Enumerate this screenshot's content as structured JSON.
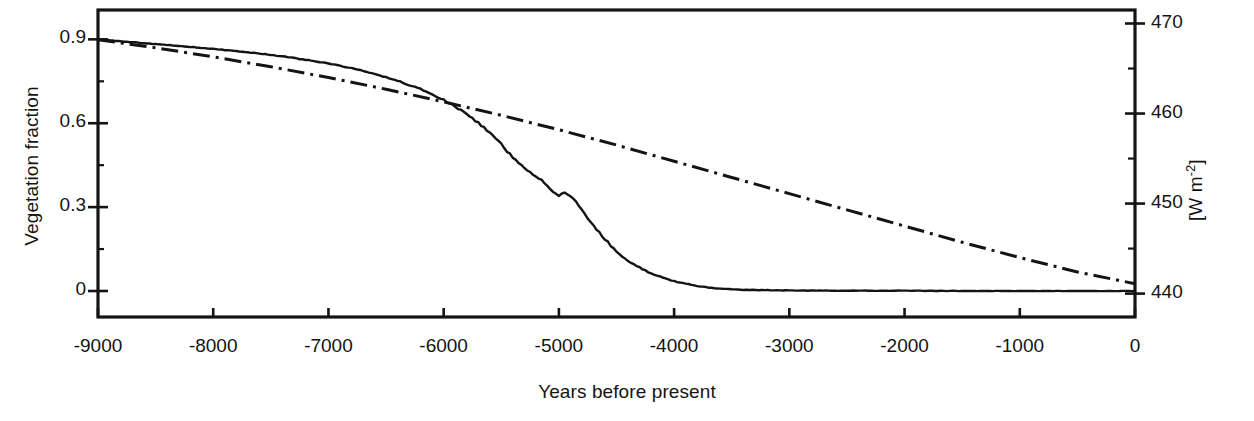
{
  "figure": {
    "background": "#ffffff",
    "ink": "#141414"
  },
  "axes": {
    "x": {
      "label": "Years before present",
      "min": -9000,
      "max": 0,
      "ticks": [
        -9000,
        -8000,
        -7000,
        -6000,
        -5000,
        -4000,
        -3000,
        -2000,
        -1000,
        0
      ],
      "tick_labels": [
        "-9000",
        "-8000",
        "-7000",
        "-6000",
        "-5000",
        "-4000",
        "-3000",
        "-2000",
        "-1000",
        "0"
      ]
    },
    "y_left": {
      "label": "Vegetation fraction",
      "min": -0.093,
      "max": 1.005,
      "ticks": [
        0,
        0.3,
        0.6,
        0.9
      ],
      "tick_labels": [
        "0",
        "0.3",
        "0.6",
        "0.9"
      ],
      "minor_ticks": [
        0.15,
        0.45,
        0.75
      ]
    },
    "y_right": {
      "label_prefix": "[W m",
      "label_exponent": "-2",
      "label_suffix": "]",
      "label_plain": "[W m-2]",
      "min": 437.4,
      "max": 471.5,
      "ticks": [
        440,
        450,
        460,
        470
      ],
      "tick_labels": [
        "440",
        "450",
        "460",
        "470"
      ],
      "minor_ticks": [
        445,
        455,
        465
      ]
    }
  },
  "chart_data": {
    "type": "line",
    "title": "",
    "xlabel": "Years before present",
    "ylabel": "Vegetation fraction",
    "ylabel_secondary": "[W m-2]",
    "xlim": [
      -9000,
      0
    ],
    "ylim": [
      -0.093,
      1.005
    ],
    "ylim_secondary": [
      437.4,
      471.5
    ],
    "grid": false,
    "legend": "none",
    "series": [
      {
        "name": "Vegetation fraction",
        "axis": "left",
        "style": "solid",
        "color": "#141414",
        "x": [
          -9000,
          -8800,
          -8600,
          -8400,
          -8200,
          -8000,
          -7800,
          -7600,
          -7400,
          -7200,
          -7000,
          -6800,
          -6600,
          -6400,
          -6200,
          -6000,
          -5900,
          -5800,
          -5700,
          -5600,
          -5500,
          -5450,
          -5400,
          -5350,
          -5300,
          -5250,
          -5200,
          -5150,
          -5100,
          -5050,
          -5000,
          -4950,
          -4900,
          -4850,
          -4800,
          -4750,
          -4700,
          -4650,
          -4600,
          -4550,
          -4500,
          -4400,
          -4300,
          -4200,
          -4100,
          -4000,
          -3900,
          -3800,
          -3700,
          -3600,
          -3400,
          -3000,
          -2500,
          -2000,
          -1500,
          -1000,
          -500,
          0
        ],
        "y": [
          0.9,
          0.893,
          0.886,
          0.88,
          0.873,
          0.866,
          0.858,
          0.849,
          0.839,
          0.827,
          0.814,
          0.797,
          0.777,
          0.752,
          0.722,
          0.684,
          0.66,
          0.632,
          0.601,
          0.566,
          0.525,
          0.5,
          0.476,
          0.46,
          0.44,
          0.427,
          0.41,
          0.396,
          0.374,
          0.355,
          0.34,
          0.352,
          0.338,
          0.316,
          0.288,
          0.262,
          0.236,
          0.21,
          0.186,
          0.163,
          0.142,
          0.109,
          0.084,
          0.063,
          0.047,
          0.035,
          0.026,
          0.018,
          0.012,
          0.008,
          0.004,
          0.002,
          0.001,
          0.001,
          0.0,
          0.0,
          0.0,
          0.0
        ]
      },
      {
        "name": "Insolation",
        "axis": "right",
        "style": "dash-dot",
        "color": "#141414",
        "x": [
          -9000,
          -8500,
          -8000,
          -7500,
          -7000,
          -6500,
          -6000,
          -5500,
          -5000,
          -4500,
          -4000,
          -3500,
          -3000,
          -2500,
          -2000,
          -1500,
          -1000,
          -500,
          0
        ],
        "y": [
          468.2,
          467.3,
          466.3,
          465.2,
          464.0,
          462.7,
          461.3,
          459.8,
          458.2,
          456.5,
          454.7,
          452.9,
          451.1,
          449.3,
          447.5,
          445.7,
          444.0,
          442.4,
          441.1
        ]
      }
    ],
    "annotations": [
      {
        "text": "curves cross near -5600 years at vegetation fraction 0.61"
      },
      {
        "text": "vegetation fraction collapses to 0 by about -3700 years"
      }
    ]
  }
}
